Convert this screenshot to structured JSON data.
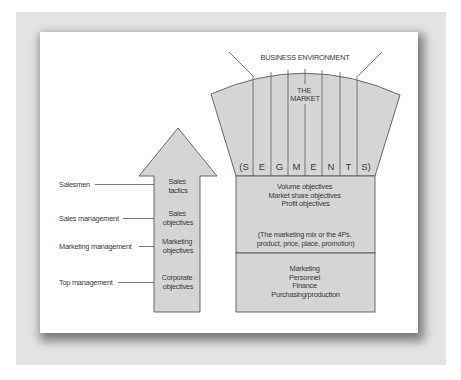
{
  "diagram": {
    "colors": {
      "frame": "#e3e3e3",
      "panel": "#ffffff",
      "shape_fill": "#d5d5d5",
      "stroke": "#5a5a5a",
      "text": "#3a3a3a"
    },
    "business_environment_label": "BUSINESS ENVIRONMENT",
    "market": {
      "title_line1": "THE",
      "title_line2": "MARKET",
      "segments_letters": [
        "(S",
        "E",
        "G",
        "M",
        "E",
        "N",
        "T",
        "S)"
      ]
    },
    "objectives_block": {
      "lines": [
        "Volume objectives",
        "Market share objectives",
        "Profit objectives"
      ],
      "mix_lines": [
        "(The marketing mix or the 4Ps,",
        "product, price, place, promotion)"
      ]
    },
    "functions_block": {
      "lines": [
        "Marketing",
        "Personnel",
        "Finance",
        "Purchasing/production"
      ]
    },
    "arrow": {
      "levels": [
        {
          "role": "Salesmen",
          "line1": "Sales",
          "line2": "tactics"
        },
        {
          "role": "Sales management",
          "line1": "Sales",
          "line2": "objectives"
        },
        {
          "role": "Marketing management",
          "line1": "Marketing",
          "line2": "objectives"
        },
        {
          "role": "Top management",
          "line1": "Corporate",
          "line2": "objectives"
        }
      ]
    }
  }
}
